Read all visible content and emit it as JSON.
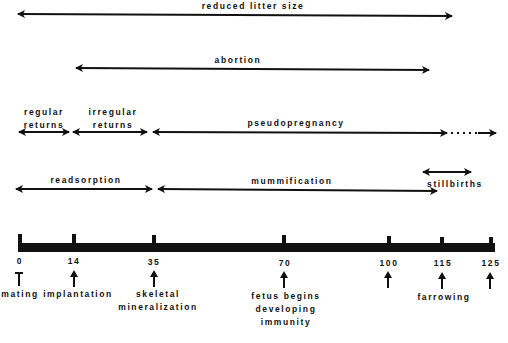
{
  "diagram": {
    "type": "timeline",
    "axis": {
      "ticks": [
        {
          "value": "0",
          "x": 19,
          "event": "mating"
        },
        {
          "value": "14",
          "x": 73,
          "event": "implantation"
        },
        {
          "value": "35",
          "x": 153,
          "event": "skeletal mineralization",
          "lines": [
            "skeletal",
            "mineralization"
          ]
        },
        {
          "value": "70",
          "x": 284,
          "event": "fetus begins developing immunity",
          "lines": [
            "fetus begins",
            "developing",
            "immunity"
          ]
        },
        {
          "value": "100",
          "x": 389,
          "event": ""
        },
        {
          "value": "115",
          "x": 442,
          "event": "farrowing"
        },
        {
          "value": "125",
          "x": 491,
          "event": ""
        }
      ]
    },
    "ranges": [
      {
        "label": "reduced litter size",
        "from": 0,
        "to": 115
      },
      {
        "label": "abortion",
        "from": 14,
        "to": 110
      },
      {
        "label": "regular returns",
        "lines": [
          "regular",
          "returns"
        ],
        "from": 0,
        "to": 14
      },
      {
        "label": "irregular returns",
        "lines": [
          "irregular",
          "returns"
        ],
        "from": 14,
        "to": 35
      },
      {
        "label": "pseudopregnancy",
        "from": 35,
        "to": 115,
        "dotted_extension_to": 125
      },
      {
        "label": "readsorption",
        "from": 0,
        "to": 35
      },
      {
        "label": "mummification",
        "from": 35,
        "to": 110
      },
      {
        "label": "stillbirths",
        "from": 110,
        "to": 120
      }
    ]
  }
}
